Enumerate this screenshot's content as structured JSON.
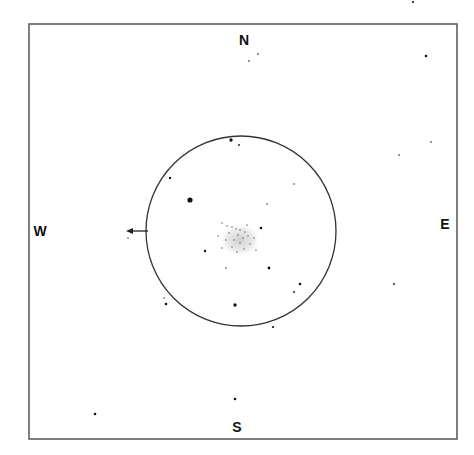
{
  "chart": {
    "frame": {
      "x": 29,
      "y": 24,
      "width": 428,
      "height": 415,
      "stroke": "#555555"
    },
    "field_circle": {
      "cx": 241,
      "cy": 231,
      "r": 95,
      "stroke": "#333333"
    },
    "compass": {
      "north": {
        "label": "N",
        "x": 244,
        "y": 40
      },
      "south": {
        "label": "S",
        "x": 237,
        "y": 427
      },
      "west": {
        "label": "W",
        "x": 40,
        "y": 231
      },
      "east": {
        "label": "E",
        "x": 445,
        "y": 224
      }
    },
    "arrow": {
      "x1": 148,
      "y1": 231,
      "x2": 126,
      "y2": 231,
      "direction": "west"
    },
    "cluster": {
      "cx": 240,
      "cy": 240,
      "rx": 22,
      "ry": 18,
      "color": "#cfcfcf"
    },
    "stars": [
      {
        "x": 249,
        "y": 61,
        "r": 0.8
      },
      {
        "x": 258,
        "y": 54,
        "r": 0.8
      },
      {
        "x": 426,
        "y": 56,
        "r": 1.3
      },
      {
        "x": 413,
        "y": 2,
        "r": 1.0
      },
      {
        "x": 399,
        "y": 155,
        "r": 0.8
      },
      {
        "x": 431,
        "y": 142,
        "r": 0.8
      },
      {
        "x": 394,
        "y": 284,
        "r": 0.9
      },
      {
        "x": 231,
        "y": 140,
        "r": 1.7
      },
      {
        "x": 239,
        "y": 145,
        "r": 0.9
      },
      {
        "x": 170,
        "y": 178,
        "r": 1.2
      },
      {
        "x": 190,
        "y": 200,
        "r": 2.6
      },
      {
        "x": 294,
        "y": 184,
        "r": 0.7
      },
      {
        "x": 267,
        "y": 204,
        "r": 0.7
      },
      {
        "x": 261,
        "y": 228,
        "r": 1.3
      },
      {
        "x": 205,
        "y": 251,
        "r": 1.2
      },
      {
        "x": 226,
        "y": 268,
        "r": 0.7
      },
      {
        "x": 269,
        "y": 268,
        "r": 1.4
      },
      {
        "x": 300,
        "y": 284,
        "r": 1.3
      },
      {
        "x": 294,
        "y": 292,
        "r": 0.9
      },
      {
        "x": 235,
        "y": 305,
        "r": 1.7
      },
      {
        "x": 166,
        "y": 304,
        "r": 1.3
      },
      {
        "x": 164,
        "y": 298,
        "r": 0.7
      },
      {
        "x": 273,
        "y": 327,
        "r": 1.1
      },
      {
        "x": 128,
        "y": 238,
        "r": 0.7
      },
      {
        "x": 235,
        "y": 399,
        "r": 1.3
      },
      {
        "x": 95,
        "y": 414,
        "r": 1.3
      }
    ],
    "cluster_stars": [
      {
        "x": 222,
        "y": 223
      },
      {
        "x": 227,
        "y": 226
      },
      {
        "x": 232,
        "y": 227
      },
      {
        "x": 236,
        "y": 229
      },
      {
        "x": 240,
        "y": 230
      },
      {
        "x": 245,
        "y": 232
      },
      {
        "x": 229,
        "y": 233
      },
      {
        "x": 238,
        "y": 235
      },
      {
        "x": 243,
        "y": 238
      },
      {
        "x": 248,
        "y": 236
      },
      {
        "x": 234,
        "y": 240
      },
      {
        "x": 226,
        "y": 240
      },
      {
        "x": 240,
        "y": 243
      },
      {
        "x": 250,
        "y": 244
      },
      {
        "x": 232,
        "y": 247
      },
      {
        "x": 244,
        "y": 249
      },
      {
        "x": 237,
        "y": 252
      },
      {
        "x": 222,
        "y": 248
      },
      {
        "x": 254,
        "y": 238
      },
      {
        "x": 218,
        "y": 236
      },
      {
        "x": 247,
        "y": 225
      },
      {
        "x": 256,
        "y": 250
      }
    ]
  }
}
